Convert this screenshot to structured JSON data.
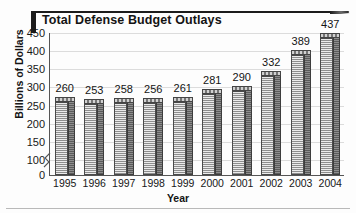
{
  "chart_data": {
    "type": "bar",
    "title": "Total Defense Budget Outlays",
    "xlabel": "Year",
    "ylabel": "Billions of Dollars",
    "categories": [
      "1995",
      "1996",
      "1997",
      "1998",
      "1999",
      "2000",
      "2001",
      "2002",
      "2003",
      "2004"
    ],
    "values": [
      260,
      253,
      258,
      256,
      261,
      281,
      290,
      332,
      389,
      437
    ],
    "ylim": [
      0,
      450
    ],
    "yticks": [
      0,
      100,
      150,
      200,
      250,
      300,
      350,
      400,
      450
    ],
    "ytick_labels": [
      "0",
      "100",
      "150",
      "200",
      "250",
      "300",
      "350",
      "400",
      "450"
    ],
    "axis_break": true,
    "axis_break_between": [
      0,
      100
    ],
    "grid": true,
    "grid_axis": "y",
    "legend": false,
    "data_labels": true,
    "bar_style": "3d",
    "colors": {
      "bar_front": "#b0b0b0",
      "bar_side": "#6e6e6e",
      "bar_top": "#9a9a9a",
      "bar_outline": "#4a4a4a",
      "gridline": "#dcdcdc",
      "axis": "#555555",
      "text": "#141414",
      "title_accent": "#1c1c1c",
      "background": "#fdfdfd"
    }
  }
}
